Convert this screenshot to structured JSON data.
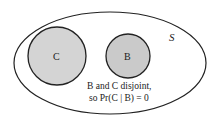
{
  "diagram": {
    "type": "venn",
    "universe": {
      "label": "S"
    },
    "sets": [
      {
        "id": "C",
        "label": "C",
        "fill": "#d4d4d4"
      },
      {
        "id": "B",
        "label": "B",
        "fill": "#cacaca"
      }
    ],
    "caption": {
      "line1": "B and C disjoint,",
      "line2": "so Pr(C | B) = 0"
    }
  }
}
